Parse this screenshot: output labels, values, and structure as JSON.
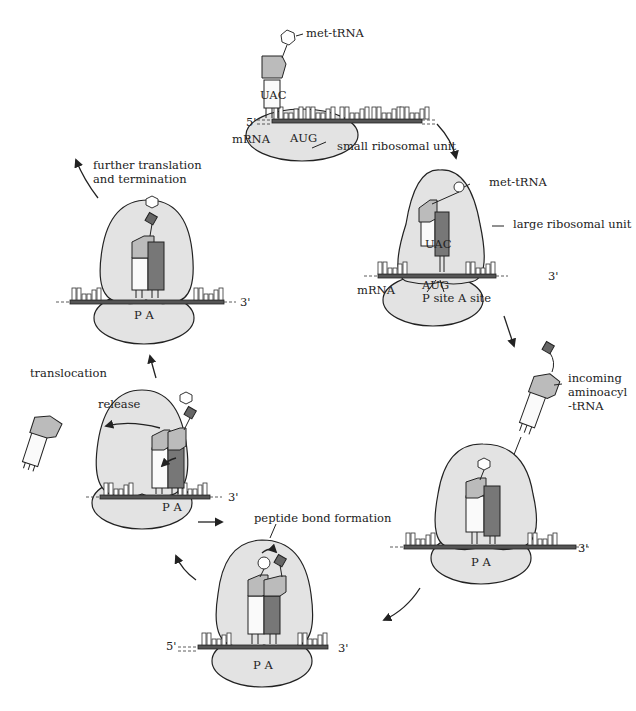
{
  "diagram": {
    "type": "cycle",
    "stages": [
      {
        "id": "initiation",
        "labels": [
          "met-tRNA",
          "UAC",
          "5'",
          "mRNA",
          "AUG",
          "small ribosomal unit"
        ]
      },
      {
        "id": "large-subunit-binding",
        "labels": [
          "met-tRNA",
          "large ribosomal unit",
          "UAC",
          "3'",
          "mRNA",
          "AUG",
          "P site A site"
        ]
      },
      {
        "id": "aminoacyl-entry",
        "labels": [
          "incoming aminoacyl -tRNA",
          "P A",
          "3'"
        ]
      },
      {
        "id": "peptide-bond",
        "labels": [
          "peptide bond formation",
          "5'",
          "P A",
          "3'"
        ]
      },
      {
        "id": "translocation-release",
        "labels": [
          "release",
          "translocation",
          "P A",
          "3'"
        ]
      },
      {
        "id": "elongation",
        "labels": [
          "further translation and termination",
          "P A",
          "3'"
        ]
      }
    ]
  },
  "labels": {
    "met_trna_top": "met-tRNA",
    "uac_top": "UAC",
    "five_prime_top": "5'",
    "mrna_top": "mRNA",
    "aug_top": "AUG",
    "small_unit": "small ribosomal unit",
    "met_trna_right": "met-tRNA",
    "large_unit": "large ribosomal unit",
    "uac_right": "UAC",
    "three_prime_right": "3'",
    "mrna_right": "mRNA",
    "aug_right": "AUG",
    "p_a_site": "P site A site",
    "incoming_1": "incoming",
    "incoming_2": "aminoacyl",
    "incoming_3": "-tRNA",
    "pa_lower_right": "P A",
    "three_prime_lower_right": "3'",
    "peptide_bond": "peptide bond formation",
    "five_prime_bottom": "5'",
    "pa_bottom": "P A",
    "three_prime_bottom": "3'",
    "release": "release",
    "translocation": "translocation",
    "pa_left": "P A",
    "three_prime_left": "3'",
    "further_1": "further translation",
    "further_2": "and termination",
    "pa_upper_left": "P A",
    "three_prime_upper_left": "3'"
  },
  "colors": {
    "ribosome_fill": "#e3e3e3",
    "trna_dark": "#777777",
    "trna_head": "#bbbbbb",
    "amino_acid_square": "#666666"
  }
}
